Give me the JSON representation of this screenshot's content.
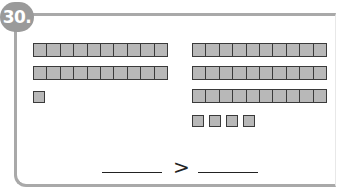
{
  "problem": {
    "number": "30.",
    "left_group": {
      "tens": 2,
      "ones": 1
    },
    "right_group": {
      "tens": 3,
      "ones": 4
    },
    "comparison_symbol": ">",
    "answer_left": "",
    "answer_right": ""
  },
  "colors": {
    "frame": "#a9a9a9",
    "badge": "#9a9a9a",
    "block_fill": "#b8b8b8",
    "block_border": "#3a3a3a"
  }
}
